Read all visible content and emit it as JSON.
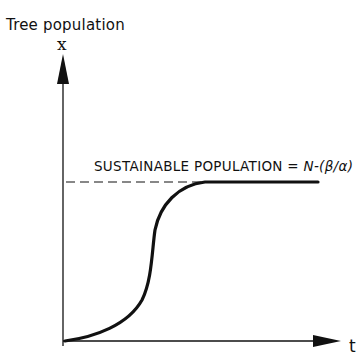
{
  "diagram": {
    "y_axis_title": "Tree population",
    "y_axis_variable": "x",
    "x_axis_variable": "t",
    "annotation_prefix": "SUSTAINABLE POPULATION = ",
    "annotation_formula": "N-(β/α)",
    "curve": "logistic S-curve approaching sustainable population asymptote",
    "asymptote_style": "dashed"
  }
}
